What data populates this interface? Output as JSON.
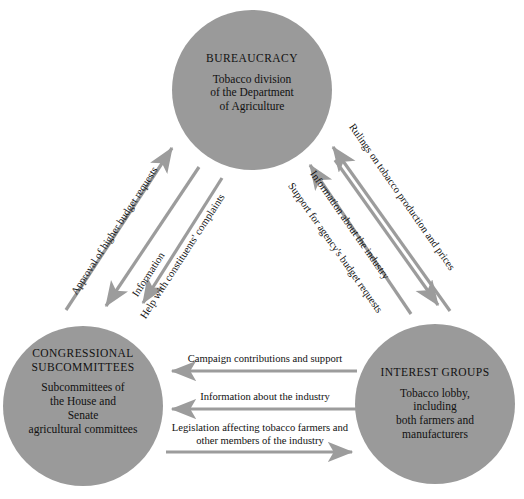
{
  "diagram": {
    "style": {
      "circle_fill": "#9a9a9a",
      "arrow_color": "#9c9c9c",
      "text_color": "#111111",
      "background": "#ffffff"
    }
  },
  "nodes": [
    {
      "id": "bureaucracy",
      "title": "BUREAUCRACY",
      "subtitle": "Tobacco division\nof the Department\nof Agriculture",
      "cx": 252,
      "cy": 90,
      "r": 80
    },
    {
      "id": "congressional-subcommittees",
      "title": "CONGRESSIONAL\nSUBCOMMITTEES",
      "subtitle": "Subcommittees of\nthe House and\nSenate\nagricultural committees",
      "cx": 83,
      "cy": 406,
      "r": 80
    },
    {
      "id": "interest-groups",
      "title": "INTEREST GROUPS",
      "subtitle": "Tobacco lobby,\nincluding\nboth farmers and\nmanufacturers",
      "cx": 435,
      "cy": 404,
      "r": 80
    }
  ],
  "edges": [
    {
      "id": "approval-of-higher-budget-requests",
      "label": "Approval of higher budget requests",
      "from": "congressional-subcommittees",
      "to": "bureaucracy",
      "side": "left",
      "direction": "up"
    },
    {
      "id": "information",
      "label": "Information",
      "from": "bureaucracy",
      "to": "congressional-subcommittees",
      "side": "left",
      "direction": "down"
    },
    {
      "id": "help-with-constituents-complaints",
      "label": "Help with constituents' complaints",
      "from": "bureaucracy",
      "to": "congressional-subcommittees",
      "side": "left",
      "direction": "down"
    },
    {
      "id": "support-for-agencys-budget-requests",
      "label": "Support for agency's budget requests",
      "from": "interest-groups",
      "to": "bureaucracy",
      "side": "right",
      "direction": "up"
    },
    {
      "id": "information-about-the-industry-right",
      "label": "Information about the industry",
      "from": "interest-groups",
      "to": "bureaucracy",
      "side": "right",
      "direction": "up"
    },
    {
      "id": "rulings-on-tobacco-production-and-prices",
      "label": "Rulings on tobacco production and prices",
      "from": "bureaucracy",
      "to": "interest-groups",
      "side": "right",
      "direction": "down"
    },
    {
      "id": "campaign-contributions-and-support",
      "label": "Campaign contributions and support",
      "from": "interest-groups",
      "to": "congressional-subcommittees",
      "side": "bottom",
      "direction": "left"
    },
    {
      "id": "information-about-the-industry-bottom",
      "label": "Information about the industry",
      "from": "interest-groups",
      "to": "congressional-subcommittees",
      "side": "bottom",
      "direction": "left"
    },
    {
      "id": "legislation-affecting-tobacco-farmers",
      "label": "Legislation affecting tobacco farmers and\nother members of the industry",
      "from": "congressional-subcommittees",
      "to": "interest-groups",
      "side": "bottom",
      "direction": "right"
    }
  ]
}
